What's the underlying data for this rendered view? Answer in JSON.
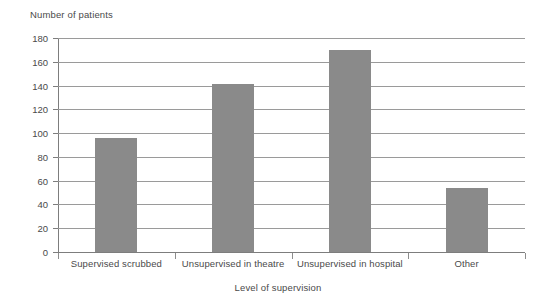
{
  "chart_data": {
    "type": "bar",
    "title": "",
    "xlabel": "Level of supervision",
    "ylabel": "Number of patients",
    "categories": [
      "Supervised scrubbed",
      "Unsupervised in theatre",
      "Unsupervised in hospital",
      "Other"
    ],
    "values": [
      96,
      141,
      170,
      54
    ],
    "ylim": [
      0,
      180
    ],
    "ytick_labels": [
      "0",
      "20",
      "40",
      "60",
      "80",
      "100",
      "120",
      "140",
      "160",
      "180"
    ],
    "ytick_values": [
      0,
      20,
      40,
      60,
      80,
      100,
      120,
      140,
      160,
      180
    ],
    "grid": true,
    "legend": "none",
    "bar_color": "#8a8a8a",
    "axis_color": "#7d7d7d",
    "grid_color": "#9a9a9a",
    "background_color": "#ffffff",
    "text_color": "#4a4a4a"
  }
}
